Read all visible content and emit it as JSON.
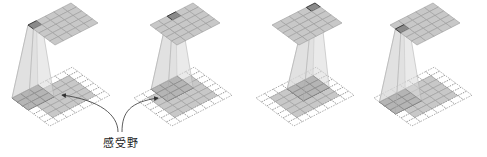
{
  "figure": {
    "label": "感受野",
    "panels": [
      {
        "id": 1,
        "output_cell": [
          0,
          0
        ],
        "receptive_field_origin": [
          0,
          0
        ],
        "ox": 0,
        "oy": 0
      },
      {
        "id": 2,
        "output_cell": [
          0,
          2
        ],
        "receptive_field_origin": [
          0,
          2
        ],
        "ox": 122,
        "oy": 0
      },
      {
        "id": 3,
        "output_cell": [
          0,
          4
        ],
        "receptive_field_origin": [
          1,
          3
        ],
        "ox": 244,
        "oy": 0
      },
      {
        "id": 4,
        "output_cell": [
          1,
          0
        ],
        "receptive_field_origin": [
          1,
          0
        ],
        "ox": 362,
        "oy": 0
      }
    ],
    "output_grid_size": 5,
    "input_grid_size": 5,
    "padding": 1,
    "kernel_size": 3
  },
  "colors": {
    "cell_fill": "#c8c8c8",
    "cell_stroke": "#9a9a9a",
    "highlight_fill": "#8a8a8a",
    "highlight_stroke": "#333333",
    "padding_stroke": "#777777",
    "frustum_fill": "#d8d8d8",
    "arrow": "#333333"
  }
}
